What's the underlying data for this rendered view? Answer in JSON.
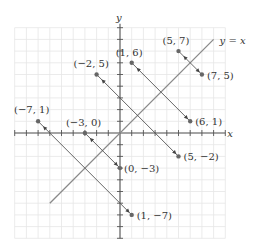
{
  "diagram": {
    "axes": {
      "x_label": "x",
      "y_label": "y",
      "range": [
        -9,
        9
      ]
    },
    "line_label": "y = x",
    "reflection_line": {
      "from": [
        -6,
        -6
      ],
      "to": [
        8,
        8
      ]
    },
    "colors": {
      "grid": "#e6e6e6",
      "axis": "#555555",
      "line": "#8a8a8a",
      "point": "#666666"
    },
    "pairs": [
      {
        "from": {
          "pt": [
            -7,
            1
          ],
          "label": "(−7, 1)"
        },
        "to": {
          "pt": [
            1,
            -7
          ],
          "label": "(1, −7)"
        }
      },
      {
        "from": {
          "pt": [
            -3,
            0
          ],
          "label": "(−3, 0)"
        },
        "to": {
          "pt": [
            0,
            -3
          ],
          "label": "(0, −3)"
        }
      },
      {
        "from": {
          "pt": [
            -2,
            5
          ],
          "label": "(−2, 5)"
        },
        "to": {
          "pt": [
            5,
            -2
          ],
          "label": "(5, −2)"
        }
      },
      {
        "from": {
          "pt": [
            1,
            6
          ],
          "label": "(1, 6)"
        },
        "to": {
          "pt": [
            6,
            1
          ],
          "label": "(6, 1)"
        }
      },
      {
        "from": {
          "pt": [
            5,
            7
          ],
          "label": "(5, 7)"
        },
        "to": {
          "pt": [
            7,
            5
          ],
          "label": "(7, 5)"
        }
      }
    ]
  }
}
